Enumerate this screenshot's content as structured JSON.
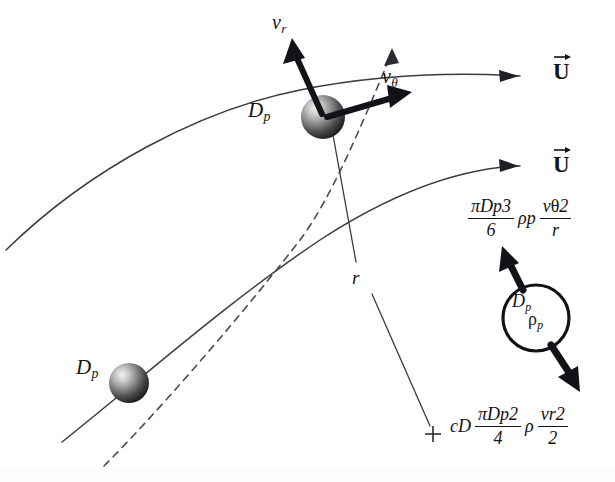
{
  "figure": {
    "background_color": "#ffffff",
    "ink_color": "#141414"
  },
  "labels": {
    "v_radial": {
      "symbol": "v",
      "subscript": "r"
    },
    "v_tangential": {
      "symbol": "v",
      "subscript": "θ"
    },
    "radius": {
      "symbol": "r"
    },
    "particle_diameter_top": {
      "symbol": "D",
      "subscript": "p"
    },
    "particle_diameter_bottom": {
      "symbol": "D",
      "subscript": "p"
    },
    "center_marker": "+"
  },
  "flow_vectors": [
    {
      "name": "upper-streamline-velocity",
      "symbol": "U",
      "accent": "vector-arrow"
    },
    {
      "name": "lower-streamline-velocity",
      "symbol": "U",
      "accent": "vector-arrow"
    }
  ],
  "free_body": {
    "particle_diameter": {
      "symbol": "D",
      "subscript": "p"
    },
    "particle_density": {
      "symbol": "ρ",
      "subscript": "p"
    },
    "centrifugal_force": {
      "numerator": "πD",
      "numerator_sub": "p",
      "numerator_sup": "3",
      "denominator": "6",
      "density": "ρ",
      "density_sub": "p",
      "velocity_num": "v",
      "velocity_num_sub": "θ",
      "velocity_num_sup": "2",
      "velocity_den": "r"
    },
    "drag_force": {
      "coefficient": "c",
      "coefficient_sub": "D",
      "numerator": "πD",
      "numerator_sub": "p",
      "numerator_sup": "2",
      "denominator": "4",
      "density": "ρ",
      "velocity_num": "v",
      "velocity_num_sub": "r",
      "velocity_num_sup": "2",
      "velocity_den": "2"
    }
  }
}
